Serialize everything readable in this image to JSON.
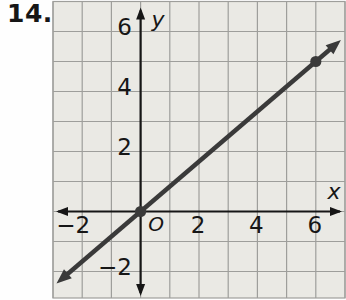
{
  "problem_label": "14.",
  "colors": {
    "page_bg": "#fefefe",
    "panel_bg": "#eae9e4",
    "grid": "#9e9e9b",
    "axis": "#161616",
    "line": "#3a3a3a",
    "text": "#161616"
  },
  "chart_data": {
    "type": "line",
    "title": "",
    "xlabel": "x",
    "ylabel": "y",
    "origin_label": "O",
    "xlim": [
      -3,
      7
    ],
    "ylim": [
      -2.9,
      7
    ],
    "grid": true,
    "x_ticks": [
      -2,
      2,
      4,
      6
    ],
    "y_ticks": [
      6,
      4,
      2,
      -2
    ],
    "line": {
      "points": [
        [
          0,
          0
        ],
        [
          6,
          5
        ]
      ],
      "arrows_both_ends": true
    },
    "marked_points": [
      [
        0,
        0
      ],
      [
        6,
        5
      ]
    ]
  }
}
